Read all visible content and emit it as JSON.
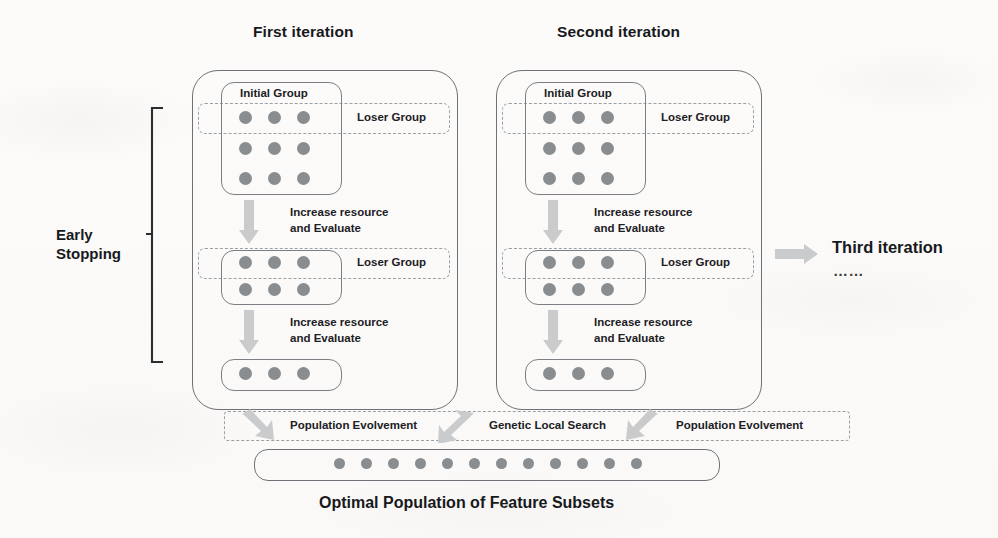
{
  "figure": {
    "caption": "Optimal Population of Feature Subsets",
    "early_stopping_line1": "Early",
    "early_stopping_line2": "Stopping",
    "third_iteration": "Third iteration",
    "third_iteration_ellipsis": "……"
  },
  "iterations": [
    {
      "title": "First iteration",
      "stages": [
        {
          "group_label": "Initial Group",
          "loser_label": "Loser Group",
          "rows": 3,
          "cols": 3,
          "dot_count": 9
        },
        {
          "group_label": "",
          "loser_label": "Loser Group",
          "rows": 2,
          "cols": 3,
          "dot_count": 6
        },
        {
          "group_label": "",
          "loser_label": "",
          "rows": 1,
          "cols": 3,
          "dot_count": 3
        }
      ],
      "transitions": [
        {
          "line1": "Increase resource",
          "line2": "and Evaluate"
        },
        {
          "line1": "Increase resource",
          "line2": "and Evaluate"
        }
      ]
    },
    {
      "title": "Second iteration",
      "stages": [
        {
          "group_label": "Initial Group",
          "loser_label": "Loser Group",
          "rows": 3,
          "cols": 3,
          "dot_count": 9
        },
        {
          "group_label": "",
          "loser_label": "Loser Group",
          "rows": 2,
          "cols": 3,
          "dot_count": 6
        },
        {
          "group_label": "",
          "loser_label": "",
          "rows": 1,
          "cols": 3,
          "dot_count": 3
        }
      ],
      "transitions": [
        {
          "line1": "Increase resource",
          "line2": "and Evaluate"
        },
        {
          "line1": "Increase resource",
          "line2": "and Evaluate"
        }
      ]
    }
  ],
  "bottom_band": {
    "labels": [
      "Population Evolvement",
      "Genetic Local Search",
      "Population Evolvement"
    ]
  },
  "final_population": {
    "dot_count": 12
  },
  "colors": {
    "dot": "#8a8d90",
    "solid_stroke": "#6e7276",
    "dashed_stroke": "#9aa0a4",
    "arrow_fill": "#c9cbcd",
    "text": "#17191c",
    "background": "#fbfaf9"
  }
}
